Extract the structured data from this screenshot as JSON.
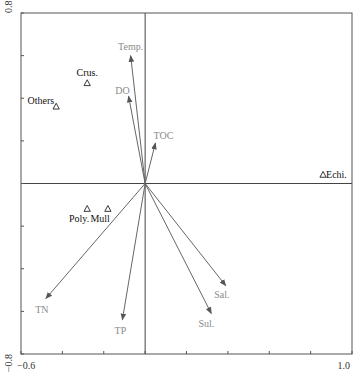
{
  "chart_data": {
    "type": "scatter",
    "subtype": "ordination-biplot",
    "title": "",
    "xlabel": "",
    "ylabel": "",
    "xlim": [
      -0.6,
      1.0
    ],
    "ylim": [
      -0.8,
      0.8
    ],
    "x_tick_step": 0.2,
    "y_tick_step": 0.2,
    "x_tick_labels": [
      {
        "value": -0.6,
        "label": "-0.6"
      },
      {
        "value": 1.0,
        "label": "1.0"
      }
    ],
    "y_tick_labels": [
      {
        "value": 0.8,
        "label": "0.8"
      },
      {
        "value": -0.8,
        "label": "-0.8"
      }
    ],
    "grid": false,
    "zero_lines": true,
    "environmental_vectors": [
      {
        "name": "Temp.",
        "x": -0.07,
        "y": 0.6
      },
      {
        "name": "DO",
        "x": -0.08,
        "y": 0.41
      },
      {
        "name": "TOC",
        "x": 0.05,
        "y": 0.19
      },
      {
        "name": "TN",
        "x": -0.48,
        "y": -0.54
      },
      {
        "name": "TP",
        "x": -0.11,
        "y": -0.64
      },
      {
        "name": "Sal.",
        "x": 0.39,
        "y": -0.48
      },
      {
        "name": "Sul.",
        "x": 0.32,
        "y": -0.61
      }
    ],
    "species": [
      {
        "name": "Crus.",
        "x": -0.28,
        "y": 0.47
      },
      {
        "name": "Others",
        "x": -0.43,
        "y": 0.36
      },
      {
        "name": "Echi.",
        "x": 0.86,
        "y": 0.04
      },
      {
        "name": "Poly.",
        "x": -0.28,
        "y": -0.12
      },
      {
        "name": "Mull",
        "x": -0.18,
        "y": -0.12
      }
    ],
    "colors": {
      "vector": "#666666",
      "vector_label": "#8a8a8a",
      "species": "#111111"
    }
  }
}
